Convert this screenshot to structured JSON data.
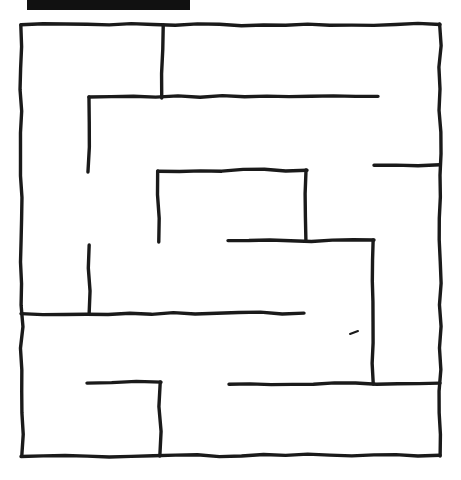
{
  "page": {
    "background_color": "#ffffff",
    "width": 461,
    "height": 480
  },
  "redaction_bar": {
    "label": "redacted-title-bar",
    "color": "#111111",
    "x": 27,
    "y": 0,
    "width": 163,
    "height": 10
  },
  "maze": {
    "label": "maze",
    "ink_color": "#1a1a1a",
    "stroke_width": 3.4,
    "bounds": {
      "left": 21,
      "top": 25,
      "right": 440,
      "bottom": 456
    },
    "border_segments": [
      {
        "name": "border-top",
        "x1": 21,
        "y1": 25,
        "x2": 440,
        "y2": 24
      },
      {
        "name": "border-left",
        "x1": 21,
        "y1": 25,
        "x2": 22,
        "y2": 456
      },
      {
        "name": "border-right",
        "x1": 440,
        "y1": 24,
        "x2": 440,
        "y2": 456
      },
      {
        "name": "border-bottom",
        "x1": 21,
        "y1": 456,
        "x2": 440,
        "y2": 455
      }
    ],
    "wall_segments": [
      {
        "name": "wall-top-vertical-divider",
        "orientation": "vertical",
        "x1": 163,
        "y1": 25,
        "x2": 162,
        "y2": 98
      },
      {
        "name": "wall-upper-long-horizontal",
        "orientation": "horizontal",
        "x1": 89,
        "y1": 97,
        "x2": 378,
        "y2": 96
      },
      {
        "name": "wall-upper-left-vertical",
        "orientation": "vertical",
        "x1": 89,
        "y1": 97,
        "x2": 88,
        "y2": 172
      },
      {
        "name": "wall-right-stub-upper",
        "orientation": "horizontal",
        "x1": 374,
        "y1": 165,
        "x2": 440,
        "y2": 165
      },
      {
        "name": "wall-center-box-top",
        "orientation": "horizontal",
        "x1": 158,
        "y1": 171,
        "x2": 307,
        "y2": 170
      },
      {
        "name": "wall-center-box-left",
        "orientation": "vertical",
        "x1": 158,
        "y1": 171,
        "x2": 159,
        "y2": 242
      },
      {
        "name": "wall-center-box-right",
        "orientation": "vertical",
        "x1": 306,
        "y1": 170,
        "x2": 306,
        "y2": 241
      },
      {
        "name": "wall-mid-horizontal",
        "orientation": "horizontal",
        "x1": 228,
        "y1": 241,
        "x2": 374,
        "y2": 240
      },
      {
        "name": "wall-right-big-vertical",
        "orientation": "vertical",
        "x1": 373,
        "y1": 240,
        "x2": 373,
        "y2": 384
      },
      {
        "name": "wall-lower-left-vertical",
        "orientation": "vertical",
        "x1": 89,
        "y1": 245,
        "x2": 89,
        "y2": 314
      },
      {
        "name": "wall-lower-long-horizontal",
        "orientation": "horizontal",
        "x1": 21,
        "y1": 314,
        "x2": 304,
        "y2": 313
      },
      {
        "name": "wall-bottom-stub",
        "orientation": "horizontal",
        "x1": 87,
        "y1": 383,
        "x2": 161,
        "y2": 382
      },
      {
        "name": "wall-bottom-vertical",
        "orientation": "vertical",
        "x1": 160,
        "y1": 382,
        "x2": 160,
        "y2": 456
      },
      {
        "name": "wall-bottom-right-horizontal",
        "orientation": "horizontal",
        "x1": 229,
        "y1": 384,
        "x2": 440,
        "y2": 383
      }
    ],
    "stray_marks": [
      {
        "name": "stray-tick-mark",
        "x1": 350,
        "y1": 334,
        "x2": 358,
        "y2": 331
      }
    ]
  }
}
